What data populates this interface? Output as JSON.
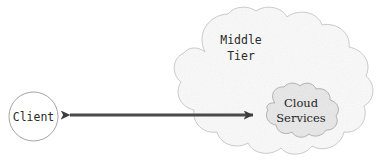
{
  "diagram": {
    "background_color": "#ffffff",
    "nodes": {
      "client": {
        "label": "Client",
        "shape": "circle",
        "fill_color": "#ffffff",
        "stroke_color": "#9a9a9a",
        "cx": 33.5,
        "cy": 116.5,
        "r": 24.5,
        "font_size": 11.5
      },
      "middle_tier": {
        "label_line1": "Middle",
        "label_line2": "Tier",
        "shape": "cloud",
        "fill_color": "#fafafa",
        "stroke_color": "#bdbdbd",
        "label_x": 241,
        "label_y1": 44,
        "label_y2": 60,
        "font_size": 11.5
      },
      "cloud_services": {
        "label_line1": "Cloud",
        "label_line2": "Services",
        "shape": "cloud",
        "fill_color": "#e9e9e9",
        "stroke_color": "#a8a8a8",
        "label_x": 301,
        "label_y1": 107,
        "label_y2": 122,
        "font_size": 11.5
      }
    },
    "connectors": [
      {
        "name": "client-to-cloud-services",
        "type": "double-headed-arrow",
        "color": "#4a4a4a",
        "from": "client",
        "to": "cloud_services",
        "x_start": 60,
        "x_end": 262,
        "y": 115,
        "thickness": 3
      }
    ]
  }
}
